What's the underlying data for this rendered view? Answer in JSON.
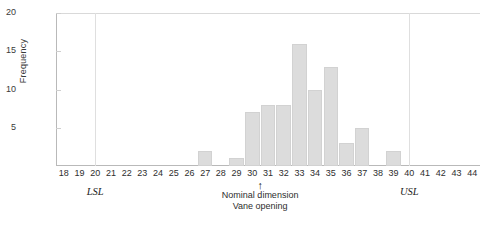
{
  "chart_data": {
    "type": "bar",
    "title": "",
    "xlabel": "",
    "ylabel": "Frequency",
    "xlim": [
      17.5,
      44.5
    ],
    "ylim": [
      0,
      20
    ],
    "yticks": [
      5,
      10,
      15,
      20
    ],
    "grid": false,
    "legend": null,
    "bar_color": "#dcdcdc",
    "categories": [
      18,
      19,
      20,
      21,
      22,
      23,
      24,
      25,
      26,
      27,
      28,
      29,
      30,
      31,
      32,
      33,
      34,
      35,
      36,
      37,
      38,
      39,
      40,
      41,
      42,
      43,
      44
    ],
    "values": [
      0,
      0,
      0,
      0,
      0,
      0,
      0,
      0,
      0,
      2,
      0,
      1,
      7,
      8,
      8,
      16,
      10,
      13,
      3,
      5,
      0,
      2,
      0,
      0,
      0,
      0,
      0
    ],
    "xtick_labels": [
      "18",
      "19",
      "20",
      "21",
      "22",
      "23",
      "24",
      "25",
      "26",
      "27",
      "28",
      "29",
      "30",
      "31",
      "32",
      "33",
      "34",
      "35",
      "36",
      "37",
      "38",
      "39",
      "40",
      "41",
      "42",
      "43",
      "44"
    ],
    "ytick_labels": [
      "5",
      "10",
      "15",
      "20"
    ],
    "annotations": [
      {
        "name": "lsl",
        "label": "LSL",
        "x": 20
      },
      {
        "name": "usl",
        "label": "USL",
        "x": 40
      },
      {
        "name": "nominal",
        "arrow": "↑",
        "line1": "Nominal dimension",
        "line2": "Vane opening",
        "x": 30.5
      }
    ]
  }
}
